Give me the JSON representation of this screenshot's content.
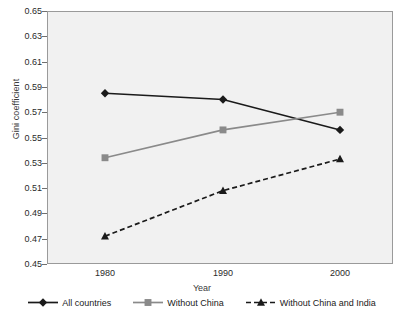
{
  "chart_data": {
    "type": "line",
    "title": "",
    "xlabel": "Year",
    "ylabel": "Gini coefficient",
    "categories": [
      "1980",
      "1990",
      "2000"
    ],
    "x": [
      1980,
      1990,
      2000
    ],
    "ylim": [
      0.45,
      0.65
    ],
    "yticks": [
      "0.65",
      "0.63",
      "0.61",
      "0.59",
      "0.57",
      "0.55",
      "0.53",
      "0.51",
      "0.49",
      "0.47",
      "0.45"
    ],
    "ytick_values": [
      0.65,
      0.63,
      0.61,
      0.59,
      0.57,
      0.55,
      0.53,
      0.51,
      0.49,
      0.47,
      0.45
    ],
    "grid": false,
    "legend_position": "bottom",
    "series": [
      {
        "name": "All countries",
        "values": [
          0.585,
          0.58,
          0.556
        ],
        "color": "#1a1a1a",
        "marker": "diamond",
        "linestyle": "solid"
      },
      {
        "name": "Without China",
        "values": [
          0.534,
          0.556,
          0.57
        ],
        "color": "#8a8a8a",
        "marker": "square",
        "linestyle": "solid"
      },
      {
        "name": "Without China and India",
        "values": [
          0.472,
          0.508,
          0.533
        ],
        "color": "#1a1a1a",
        "marker": "triangle",
        "linestyle": "dashed"
      }
    ]
  },
  "axes": {
    "y_title": "Gini coefficient",
    "x_title": "Year"
  },
  "legend": {
    "items": [
      {
        "label": "All countries"
      },
      {
        "label": "Without China"
      },
      {
        "label": "Without China and India"
      }
    ]
  },
  "colors": {
    "plot_background": "#f1f1f1",
    "plot_border": "#9a9a9a",
    "series_dark": "#1a1a1a",
    "series_gray": "#8a8a8a",
    "page_background": "#ffffff"
  }
}
